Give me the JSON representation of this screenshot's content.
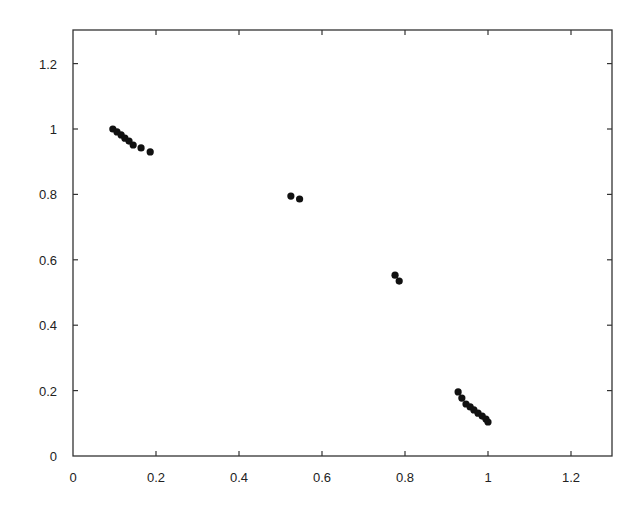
{
  "chart_data": {
    "type": "scatter",
    "title": "",
    "xlabel": "",
    "ylabel": "",
    "xlim": [
      0,
      1.3
    ],
    "ylim": [
      0,
      1.3
    ],
    "grid": false,
    "legend": null,
    "x_ticks": [
      "0",
      "0.2",
      "0.4",
      "0.6",
      "0.8",
      "1",
      "1.2"
    ],
    "y_ticks": [
      "0",
      "0.2",
      "0.4",
      "0.6",
      "0.8",
      "1",
      "1.2"
    ],
    "marker_color": "#111111",
    "series": [
      {
        "name": "points",
        "x": [
          0.096,
          0.106,
          0.116,
          0.125,
          0.135,
          0.145,
          0.164,
          0.186,
          0.525,
          0.546,
          0.776,
          0.786,
          0.928,
          0.937,
          0.947,
          0.957,
          0.966,
          0.976,
          0.986,
          0.995,
          1.0
        ],
        "y": [
          1.0,
          0.991,
          0.982,
          0.972,
          0.963,
          0.951,
          0.942,
          0.93,
          0.795,
          0.786,
          0.553,
          0.535,
          0.196,
          0.177,
          0.159,
          0.15,
          0.141,
          0.131,
          0.122,
          0.113,
          0.104
        ]
      }
    ]
  }
}
